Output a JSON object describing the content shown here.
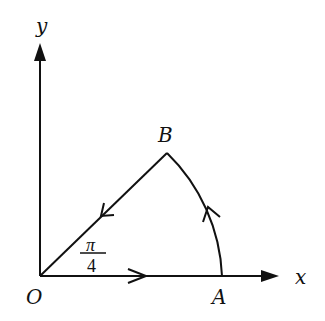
{
  "diagram": {
    "type": "contour-sector",
    "axes": {
      "x_label": "x",
      "y_label": "y"
    },
    "points": {
      "origin": "O",
      "a": "A",
      "b": "B"
    },
    "angle": {
      "numerator": "π",
      "denominator": "4"
    },
    "colors": {
      "stroke": "#111111",
      "background": "#ffffff"
    }
  }
}
